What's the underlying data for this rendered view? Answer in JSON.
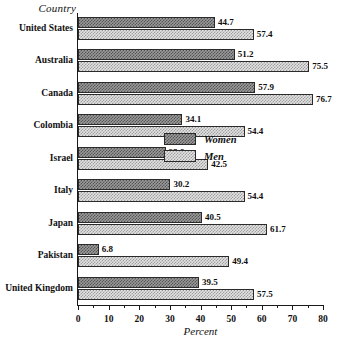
{
  "chart_data": {
    "type": "bar",
    "orientation": "horizontal",
    "title": "",
    "xlabel": "Percent",
    "ylabel": "Country",
    "xlim": [
      0,
      80
    ],
    "grid": false,
    "legend_position": "inside-right",
    "xticks": [
      0,
      10,
      20,
      30,
      40,
      50,
      60,
      70,
      80
    ],
    "xtick_labels": [
      "0",
      "10",
      "20",
      "30",
      "40",
      "50",
      "60",
      "70",
      "80"
    ],
    "xminor_ticks": [
      5,
      15,
      25,
      35,
      45,
      55,
      65,
      75
    ],
    "categories": [
      "United States",
      "Australia",
      "Canada",
      "Colombia",
      "Israel",
      "Italy",
      "Japan",
      "Pakistan",
      "United Kingdom"
    ],
    "series": [
      {
        "name": "Women",
        "values": [
          44.7,
          51.2,
          57.9,
          34.1,
          28.6,
          30.2,
          40.5,
          6.8,
          39.5
        ]
      },
      {
        "name": "Men",
        "values": [
          57.4,
          75.5,
          76.7,
          54.4,
          42.5,
          54.4,
          61.7,
          49.4,
          57.5
        ]
      }
    ],
    "data_labels": {
      "Women": [
        "44.7",
        "51.2",
        "57.9",
        "34.1",
        "28.6",
        "30.2",
        "40.5",
        "6.8",
        "39.5"
      ],
      "Men": [
        "57.4",
        "75.5",
        "76.7",
        "54.4",
        "42.5",
        "54.4",
        "61.7",
        "49.4",
        "57.5"
      ]
    }
  },
  "legend": {
    "items": [
      {
        "label": "Women",
        "swatch": "dark-crosshatch"
      },
      {
        "label": "Men",
        "swatch": "light-crosshatch"
      }
    ]
  },
  "caption": {
    "sliver_text": ""
  }
}
